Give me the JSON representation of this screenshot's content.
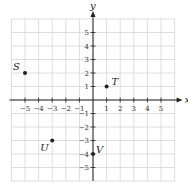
{
  "chart_data": {
    "type": "scatter",
    "title": "",
    "xlabel": "x",
    "ylabel": "y",
    "xlim": [
      -6,
      6
    ],
    "ylim": [
      -6,
      6
    ],
    "grid": true,
    "x_ticks": [
      -5,
      -4,
      -3,
      -2,
      -1,
      1,
      2,
      3,
      4,
      5
    ],
    "y_ticks": [
      -5,
      -4,
      -3,
      -2,
      -1,
      1,
      2,
      3,
      4,
      5
    ],
    "points": [
      {
        "label": "S",
        "x": -5,
        "y": 2
      },
      {
        "label": "T",
        "x": 1,
        "y": 1
      },
      {
        "label": "U",
        "x": -3,
        "y": -3
      },
      {
        "label": "V",
        "x": 0,
        "y": -4
      }
    ]
  },
  "colors": {
    "grid": "#d6d6d6",
    "axis": "#222222",
    "point": "#222222"
  }
}
